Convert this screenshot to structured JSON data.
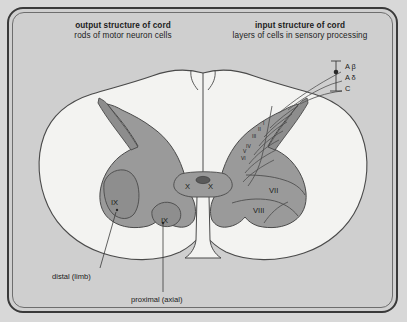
{
  "figure": {
    "headers": {
      "left": {
        "title": "output structure of cord",
        "subtitle": "rods of motor neuron cells"
      },
      "right": {
        "title": "input structure of cord",
        "subtitle": "layers of cells in sensory processing"
      }
    },
    "labels": {
      "lamina_ix_distal": "IX",
      "lamina_ix_proximal": "IX",
      "lamina_x_left": "X",
      "lamina_x_right": "X",
      "lamina_vii": "VII",
      "lamina_viii": "VIII",
      "lamina_i": "I",
      "lamina_ii": "II",
      "lamina_iii": "III",
      "lamina_iv": "IV",
      "lamina_v": "V",
      "lamina_vi": "VI",
      "distal": "distal (limb)",
      "proximal": "proximal (axial)"
    },
    "fibers": [
      {
        "name": "A-beta",
        "label": "A β",
        "terminal": "open"
      },
      {
        "name": "A-delta",
        "label": "A δ",
        "terminal": "filled"
      },
      {
        "name": "C",
        "label": "C",
        "terminal": "none"
      }
    ],
    "colors": {
      "background": "#d8d8d8",
      "panel": "#cfcfcf",
      "frame": "#3a3a3a",
      "white_matter": "#f2f2f0",
      "gray_matter": "#969696",
      "gray_matter_light": "#a8a8a8",
      "outline": "#3f3f3f",
      "text": "#1a1a1a"
    }
  }
}
